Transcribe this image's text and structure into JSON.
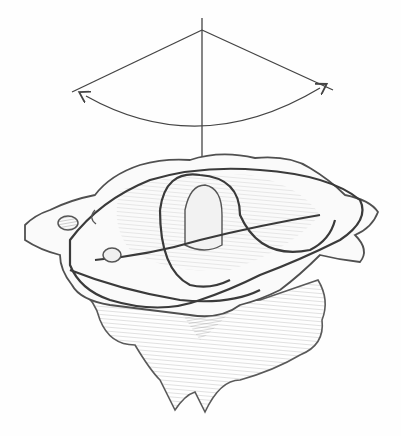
{
  "figure": {
    "style": "pencil-drawing",
    "colors": {
      "background": "#fefefe",
      "stroke_dark": "#3a3a3a",
      "stroke_mid": "#6a6a6a",
      "shade": "#9a9a9a",
      "shade_light": "#c8c8c8"
    },
    "elements": [
      "vertical-axis-line",
      "rotation-angle-lines",
      "double-headed-rotation-arc",
      "atlas-ring",
      "axis-vertebra-body"
    ]
  }
}
